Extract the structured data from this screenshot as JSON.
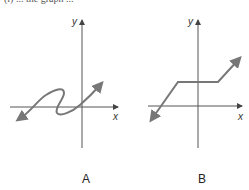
{
  "caption": "(i) ... the graph ...",
  "graphs": [
    {
      "id": "A",
      "label": "A",
      "x_axis_label": "x",
      "y_axis_label": "y",
      "description": "S-shaped curve crossing the x-axis multiple times, arrows at both ends"
    },
    {
      "id": "B",
      "label": "B",
      "x_axis_label": "x",
      "y_axis_label": "y",
      "description": "Piecewise linear: rising segment, horizontal segment, rising segment, arrows at both ends"
    }
  ],
  "colors": {
    "axis": "#555555",
    "curve": "#777777"
  }
}
